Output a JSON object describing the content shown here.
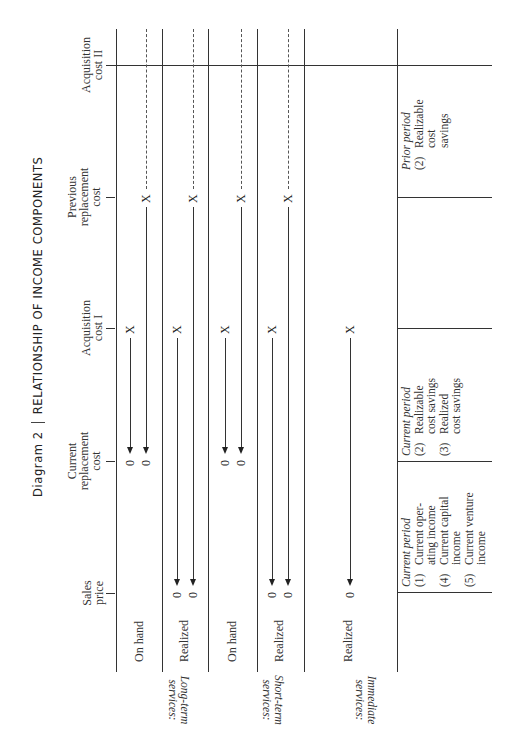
{
  "title": {
    "diagram_label": "Diagram 2",
    "text": "RELATIONSHIP OF INCOME COMPONENTS"
  },
  "axis": {
    "ticks": [
      {
        "id": "acquisition-cost-2",
        "line1": "Acquisition",
        "line2": "cost II",
        "line3": ""
      },
      {
        "id": "previous-replacement-cost",
        "line1": "Previous",
        "line2": "replacement",
        "line3": "cost"
      },
      {
        "id": "acquisition-cost-1",
        "line1": "Acquisition",
        "line2": "cost I",
        "line3": ""
      },
      {
        "id": "current-replacement-cost",
        "line1": "Current",
        "line2": "replacement",
        "line3": "cost"
      },
      {
        "id": "sales-price",
        "line1": "Sales",
        "line2": "price",
        "line3": ""
      }
    ]
  },
  "groups": [
    {
      "label_line1": "Long-term",
      "label_line2": "services:",
      "rows": [
        "On hand",
        "Realized"
      ]
    },
    {
      "label_line1": "Short-term",
      "label_line2": "services:",
      "rows": [
        "On hand",
        "Realized"
      ]
    },
    {
      "label_line1": "Immediate",
      "label_line2": "services:",
      "rows": [
        "Realized"
      ]
    }
  ],
  "marks": {
    "x": "X",
    "zero": "0"
  },
  "panels": {
    "prior": {
      "heading": "Prior period",
      "items": [
        {
          "num": "(2)",
          "text": "Realizable cost savings"
        }
      ]
    },
    "current_savings": {
      "heading": "Current period",
      "items": [
        {
          "num": "(2)",
          "text": "Realizable cost savings"
        },
        {
          "num": "(3)",
          "text": "Realized cost savings"
        }
      ]
    },
    "current_income": {
      "heading": "Current period",
      "items": [
        {
          "num": "(1)",
          "text": "Current oper-ating income"
        },
        {
          "num": "(4)",
          "text": "Current capital income"
        },
        {
          "num": "(5)",
          "text": "Current venture income"
        }
      ]
    }
  }
}
